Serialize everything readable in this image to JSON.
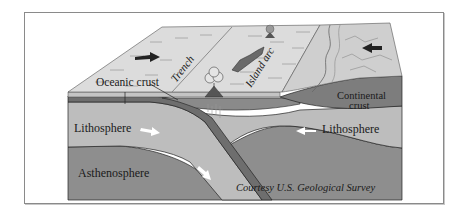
{
  "diagram": {
    "labels": {
      "trench": "Trench",
      "island_arc": "Island arc",
      "oceanic_crust": "Oceanic crust",
      "continental_crust_line1": "Continental",
      "continental_crust_line2": "crust",
      "lithosphere_left": "Lithosphere",
      "lithosphere_right": "Lithosphere",
      "asthenosphere": "Asthenosphere",
      "credit": "Courtesy U.S. Geological Survey"
    },
    "arrows": [
      {
        "id": "top-left-arrow",
        "direction": "right"
      },
      {
        "id": "top-right-arrow",
        "direction": "left"
      },
      {
        "id": "lithosphere-left-arrow",
        "direction": "right"
      },
      {
        "id": "subduction-arrow",
        "direction": "down-right"
      },
      {
        "id": "lithosphere-right-arrow",
        "direction": "left"
      }
    ],
    "colors": {
      "top_surface": "#dcdcdc",
      "continent_top": "#cfcfcf",
      "lithosphere": "#bdbdbd",
      "asthenosphere": "#8e8e8e",
      "crust_band": "#6e6e6e",
      "continental_crust": "#7d7d7d",
      "frame": "#8a8a8a"
    }
  }
}
